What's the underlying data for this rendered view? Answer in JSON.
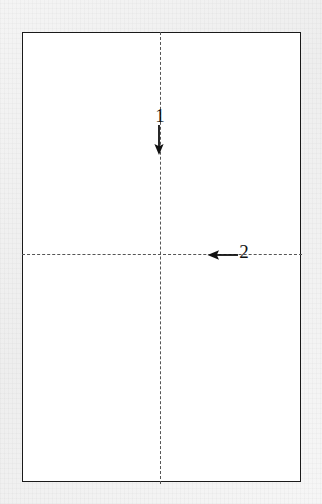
{
  "figure": {
    "caption": "",
    "background_color": "#f1f1f1",
    "sheet": {
      "name": "paper-sheet",
      "fill_color": "#ffffff",
      "border_color": "#1a1a1a"
    },
    "fold_lines": [
      {
        "id": "vertical-center-fold",
        "orientation": "vertical",
        "style": "dashed",
        "color": "#555555"
      },
      {
        "id": "horizontal-center-fold",
        "orientation": "horizontal",
        "style": "dashed",
        "color": "#555555"
      }
    ],
    "steps": [
      {
        "number": "1",
        "label": "1",
        "arrow_direction": "down",
        "arrow_color": "#111111"
      },
      {
        "number": "2",
        "label": "2",
        "arrow_direction": "left",
        "arrow_color": "#111111"
      }
    ]
  }
}
